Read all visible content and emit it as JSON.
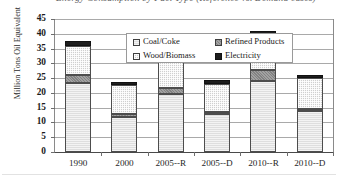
{
  "figure": {
    "title": "Energy Consumption by Fuel Type (Reference vs. Demand cases)",
    "bottom_rule": ""
  },
  "axes": {
    "ylabel": "Million Tons Oil Equivalent",
    "xlabel": "",
    "yticks": [
      "0",
      "5",
      "10",
      "15",
      "20",
      "25",
      "30",
      "35",
      "40",
      "45"
    ],
    "ymin": 0,
    "ymax": 45,
    "ystep": 5
  },
  "legend": {
    "position": "top-center-inside",
    "entries": [
      {
        "label": "Coal/Coke",
        "key": "coal",
        "color": "#dedede"
      },
      {
        "label": "Refined Products",
        "key": "refined",
        "color": "#8d8d8d"
      },
      {
        "label": "Wood/Biomass",
        "key": "wood",
        "color": "#cfcfcf"
      },
      {
        "label": "Electricity",
        "key": "elec",
        "color": "#1d1d1d"
      }
    ]
  },
  "chart_data": {
    "type": "bar",
    "subtype": "stacked-vertical",
    "title": "Energy Consumption by Fuel Type (Reference vs. Demand cases)",
    "xlabel": "",
    "ylabel": "Million Tons Oil Equivalent",
    "ylim": [
      0,
      45
    ],
    "ytick_step": 5,
    "grid": true,
    "legend_position": "top-center-inside",
    "categories": [
      "1990",
      "2000",
      "2005--R",
      "2005--D",
      "2010--R",
      "2010--D"
    ],
    "series": [
      {
        "name": "Coal/Coke",
        "color": "#dedede",
        "values": [
          23.5,
          11.7,
          19.5,
          12.7,
          24.0,
          13.8
        ]
      },
      {
        "name": "Refined Products",
        "color": "#8d8d8d",
        "values": [
          2.5,
          1.3,
          2.3,
          0.9,
          3.7,
          0.7
        ]
      },
      {
        "name": "Wood/Biomass",
        "color": "#cfcfcf",
        "values": [
          10.0,
          9.8,
          10.0,
          9.4,
          10.5,
          10.5
        ]
      },
      {
        "name": "Electricity",
        "color": "#1d1d1d",
        "values": [
          1.5,
          0.9,
          2.2,
          1.3,
          2.8,
          1.0
        ]
      }
    ],
    "totals": [
      37.5,
      23.7,
      34.0,
      24.3,
      41.0,
      26.0
    ]
  }
}
